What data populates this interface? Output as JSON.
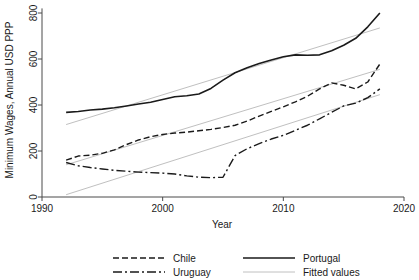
{
  "chart_data": {
    "type": "line",
    "title": "",
    "xlabel": "Year",
    "ylabel": "Minimum Wages, Annual USD PPP",
    "xlim": [
      1990,
      2020
    ],
    "ylim": [
      0,
      860
    ],
    "xticks": [
      1990,
      2000,
      2010,
      2020
    ],
    "xtick_labels": [
      "1990",
      "2000",
      "2010",
      "2020"
    ],
    "yticks": [
      0,
      200,
      400,
      600,
      800
    ],
    "ytick_labels": [
      "0",
      "200",
      "400",
      "600",
      "800"
    ],
    "grid": false,
    "legend_position": "bottom",
    "series": [
      {
        "name": "Chile",
        "style": "dashed",
        "color": "#1a1a1a",
        "x": [
          1992,
          1993,
          1994,
          1995,
          1996,
          1997,
          1998,
          1999,
          2000,
          2001,
          2002,
          2003,
          2004,
          2005,
          2006,
          2007,
          2008,
          2009,
          2010,
          2011,
          2012,
          2013,
          2014,
          2015,
          2016,
          2017,
          2018
        ],
        "y": [
          160,
          178,
          182,
          190,
          205,
          228,
          248,
          262,
          272,
          278,
          282,
          288,
          294,
          302,
          312,
          330,
          352,
          372,
          392,
          414,
          438,
          470,
          496,
          486,
          470,
          500,
          578
        ]
      },
      {
        "name": "Uruguay",
        "style": "dash-dot",
        "color": "#1a1a1a",
        "x": [
          1992,
          1993,
          1994,
          1995,
          1996,
          1997,
          1998,
          1999,
          2000,
          2001,
          2002,
          2003,
          2004,
          2005,
          2006,
          2007,
          2008,
          2009,
          2010,
          2011,
          2012,
          2013,
          2014,
          2015,
          2016,
          2017,
          2018
        ],
        "y": [
          150,
          136,
          128,
          122,
          116,
          112,
          108,
          106,
          104,
          100,
          92,
          86,
          84,
          86,
          180,
          210,
          232,
          252,
          268,
          290,
          312,
          340,
          368,
          396,
          408,
          432,
          470
        ]
      },
      {
        "name": "Portugal",
        "style": "solid",
        "color": "#1a1a1a",
        "x": [
          1992,
          1993,
          1994,
          1995,
          1996,
          1997,
          1998,
          1999,
          2000,
          2001,
          2002,
          2003,
          2004,
          2005,
          2006,
          2007,
          2008,
          2009,
          2010,
          2011,
          2012,
          2013,
          2014,
          2015,
          2016,
          2017,
          2018
        ],
        "y": [
          368,
          372,
          378,
          382,
          388,
          396,
          404,
          412,
          424,
          436,
          440,
          448,
          472,
          508,
          540,
          562,
          580,
          596,
          610,
          618,
          616,
          618,
          636,
          660,
          690,
          740,
          800
        ]
      }
    ],
    "fitted_lines": [
      {
        "name": "Fitted values",
        "style": "solid-light",
        "color": "#c0c0c0",
        "x": [
          1992,
          2018
        ],
        "y": [
          315,
          735
        ]
      },
      {
        "name": "Fitted values",
        "style": "solid-light",
        "color": "#c0c0c0",
        "x": [
          1992,
          2018
        ],
        "y": [
          140,
          555
        ]
      },
      {
        "name": "Fitted values",
        "style": "solid-light",
        "color": "#c0c0c0",
        "x": [
          1992,
          2018
        ],
        "y": [
          10,
          445
        ]
      }
    ],
    "legend": [
      {
        "label": "Chile",
        "style": "dashed",
        "color": "#1a1a1a"
      },
      {
        "label": "Uruguay",
        "style": "dash-dot",
        "color": "#1a1a1a"
      },
      {
        "label": "Portugal",
        "style": "solid",
        "color": "#1a1a1a"
      },
      {
        "label": "Fitted values",
        "style": "solid-light",
        "color": "#c0c0c0"
      }
    ]
  }
}
